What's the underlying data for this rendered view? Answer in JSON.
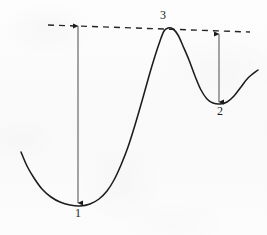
{
  "figure": {
    "background_color": "#fbfbfb",
    "ink_color": "#1a1a1a",
    "width": 267,
    "height": 235
  },
  "labels": {
    "min1": "1",
    "min2": "2",
    "max3": "3"
  },
  "annotations": {
    "reference_line": {
      "name": "dashed-reference-line",
      "style": "dashed",
      "start": [
        48,
        25
      ],
      "end": [
        250,
        32
      ]
    },
    "arrows": [
      {
        "name": "depth-arrow-min1",
        "label": "1",
        "x": 78,
        "y_top": 25,
        "y_bottom": 204,
        "double_headed": true
      },
      {
        "name": "depth-arrow-min2",
        "label": "2",
        "x": 219,
        "y_top": 33,
        "y_bottom": 103,
        "double_headed": true
      }
    ]
  },
  "chart_data": {
    "type": "line",
    "title": "",
    "xlabel": "",
    "ylabel": "",
    "grid": false,
    "legend": null,
    "xlim": [
      0,
      267
    ],
    "ylim": [
      235,
      0
    ],
    "annotated_points": [
      {
        "label": "1",
        "role": "global-minimum",
        "x": 80,
        "y": 206
      },
      {
        "label": "3",
        "role": "local-maximum",
        "x": 163,
        "y": 29
      },
      {
        "label": "2",
        "role": "local-minimum",
        "x": 220,
        "y": 104
      }
    ],
    "curve_points": [
      [
        21,
        152
      ],
      [
        27,
        166
      ],
      [
        34,
        178
      ],
      [
        42,
        189
      ],
      [
        51,
        197
      ],
      [
        60,
        202
      ],
      [
        70,
        205
      ],
      [
        80,
        206
      ],
      [
        90,
        204
      ],
      [
        99,
        199
      ],
      [
        107,
        191
      ],
      [
        114,
        180
      ],
      [
        121,
        165
      ],
      [
        128,
        147
      ],
      [
        135,
        125
      ],
      [
        142,
        101
      ],
      [
        149,
        76
      ],
      [
        155,
        56
      ],
      [
        160,
        41
      ],
      [
        164,
        31
      ],
      [
        168,
        28
      ],
      [
        173,
        29
      ],
      [
        178,
        35
      ],
      [
        183,
        46
      ],
      [
        189,
        60
      ],
      [
        195,
        76
      ],
      [
        201,
        90
      ],
      [
        207,
        99
      ],
      [
        213,
        103
      ],
      [
        220,
        104
      ],
      [
        227,
        102
      ],
      [
        234,
        96
      ],
      [
        241,
        87
      ],
      [
        248,
        78
      ],
      [
        258,
        70
      ]
    ]
  }
}
